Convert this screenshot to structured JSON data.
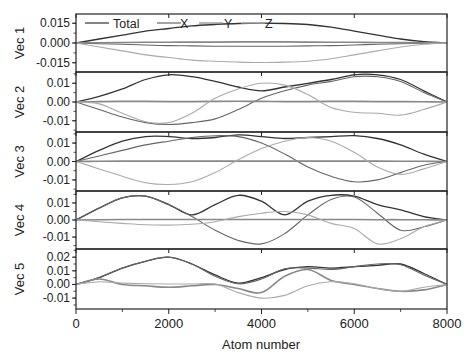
{
  "chart_data": {
    "type": "line",
    "title": "",
    "xlabel": "Atom number",
    "xlim": [
      0,
      8000
    ],
    "xticks": [
      0,
      2000,
      4000,
      6000,
      8000
    ],
    "xtick_labels": [
      "0",
      "2000",
      "4000",
      "6000",
      "8000"
    ],
    "legend": [
      "Total",
      "X",
      "Y",
      "Z"
    ],
    "legend_position": "top of first panel",
    "series_colors": {
      "Total": "#333333",
      "X": "#666666",
      "Y": "#888888",
      "Z": "#aaaaaa"
    },
    "x": [
      0,
      500,
      1000,
      1500,
      2000,
      2500,
      3000,
      3500,
      4000,
      4500,
      5000,
      5500,
      6000,
      6500,
      7000,
      7500,
      8000
    ],
    "panels": [
      {
        "ylabel": "Vec 1",
        "ylim": [
          -0.022,
          0.022
        ],
        "yticks": [
          0.015,
          0.0,
          -0.015
        ],
        "ytick_labels": [
          "0.015",
          "0.000",
          "-0.015"
        ],
        "series": [
          {
            "name": "Total",
            "values": [
              0,
              0.003,
              0.006,
              0.009,
              0.011,
              0.013,
              0.014,
              0.0148,
              0.015,
              0.0148,
              0.014,
              0.012,
              0.009,
              0.006,
              0.003,
              0.001,
              0
            ]
          },
          {
            "name": "X",
            "values": [
              0,
              -0.0005,
              -0.001,
              -0.0015,
              -0.002,
              -0.0022,
              -0.0024,
              -0.0025,
              -0.0025,
              -0.0024,
              -0.0022,
              -0.002,
              -0.0015,
              -0.001,
              -0.0006,
              -0.0002,
              0
            ]
          },
          {
            "name": "Y",
            "values": [
              0,
              0.0002,
              0.0004,
              0.0005,
              0.0006,
              0.0007,
              0.0007,
              0.0008,
              0.0008,
              0.0008,
              0.0007,
              0.0006,
              0.0005,
              0.0004,
              0.0003,
              0.0001,
              0
            ]
          },
          {
            "name": "Z",
            "values": [
              0,
              -0.003,
              -0.006,
              -0.009,
              -0.011,
              -0.013,
              -0.0138,
              -0.0145,
              -0.0148,
              -0.0145,
              -0.0138,
              -0.012,
              -0.009,
              -0.006,
              -0.003,
              -0.001,
              0
            ]
          }
        ]
      },
      {
        "ylabel": "Vec 2",
        "ylim": [
          -0.016,
          0.016
        ],
        "yticks": [
          0.01,
          0.0,
          -0.01
        ],
        "ytick_labels": [
          "0.01",
          "0.00",
          "-0.01"
        ],
        "series": [
          {
            "name": "Total",
            "values": [
              0,
              0.003,
              0.007,
              0.012,
              0.0145,
              0.0135,
              0.011,
              0.008,
              0.006,
              0.008,
              0.01,
              0.012,
              0.0145,
              0.0145,
              0.012,
              0.006,
              0
            ]
          },
          {
            "name": "X",
            "values": [
              0,
              -0.004,
              -0.008,
              -0.011,
              -0.012,
              -0.011,
              -0.009,
              -0.004,
              0.002,
              0.006,
              0.009,
              0.011,
              0.0135,
              0.0135,
              0.011,
              0.005,
              0
            ]
          },
          {
            "name": "Y",
            "values": [
              0,
              0.0002,
              0.0003,
              0.0003,
              0.0002,
              0.0002,
              0.0003,
              0.0004,
              0.0003,
              0.0002,
              0.0002,
              0.0003,
              0.0003,
              0.0002,
              0.0002,
              0.0001,
              0
            ]
          },
          {
            "name": "Z",
            "values": [
              0,
              -0.001,
              -0.006,
              -0.0105,
              -0.011,
              -0.006,
              0.002,
              0.007,
              0.01,
              0.009,
              0.004,
              -0.003,
              -0.0055,
              -0.006,
              -0.007,
              -0.004,
              0
            ]
          }
        ]
      },
      {
        "ylabel": "Vec 3",
        "ylim": [
          -0.016,
          0.016
        ],
        "yticks": [
          0.01,
          0.0,
          -0.01
        ],
        "ytick_labels": [
          "0.01",
          "0.00",
          "-0.01"
        ],
        "series": [
          {
            "name": "Total",
            "values": [
              0,
              0.006,
              0.011,
              0.0135,
              0.0135,
              0.0125,
              0.013,
              0.0145,
              0.0135,
              0.0125,
              0.013,
              0.0135,
              0.014,
              0.0125,
              0.009,
              0.004,
              0
            ]
          },
          {
            "name": "X",
            "values": [
              0,
              0.003,
              0.006,
              0.009,
              0.011,
              0.013,
              0.014,
              0.0135,
              0.01,
              0.004,
              -0.003,
              -0.008,
              -0.011,
              -0.01,
              -0.006,
              -0.002,
              0
            ]
          },
          {
            "name": "Y",
            "values": [
              0,
              0.0001,
              0.0002,
              0.0002,
              0.0002,
              0.0002,
              0.0002,
              0.0002,
              0.0002,
              0.0002,
              0.0002,
              0.0002,
              0.0002,
              0.0002,
              0.0001,
              0.0001,
              0
            ]
          },
          {
            "name": "Z",
            "values": [
              0,
              -0.004,
              -0.008,
              -0.0115,
              -0.0125,
              -0.011,
              -0.006,
              0.001,
              0.007,
              0.011,
              0.013,
              0.011,
              0.005,
              -0.003,
              -0.007,
              -0.004,
              0
            ]
          }
        ]
      },
      {
        "ylabel": "Vec 4",
        "ylim": [
          -0.017,
          0.017
        ],
        "yticks": [
          0.01,
          0.0,
          -0.01
        ],
        "ytick_labels": [
          "0.01",
          "0.00",
          "-0.01"
        ],
        "series": [
          {
            "name": "Total",
            "values": [
              0,
              0.007,
              0.013,
              0.014,
              0.009,
              0.003,
              0.009,
              0.0145,
              0.011,
              0.003,
              0.011,
              0.0145,
              0.014,
              0.009,
              0.006,
              0.002,
              0
            ]
          },
          {
            "name": "X",
            "values": [
              0,
              0.007,
              0.013,
              0.014,
              0.009,
              0.002,
              -0.006,
              -0.012,
              -0.014,
              -0.008,
              0.003,
              0.012,
              0.0135,
              0.004,
              -0.006,
              -0.004,
              0
            ]
          },
          {
            "name": "Y",
            "values": [
              0,
              0.0002,
              0.0003,
              0.0003,
              0.0003,
              0.0003,
              0.0003,
              0.0003,
              0.0003,
              0.0003,
              0.0003,
              0.0003,
              0.0003,
              0.0002,
              0.0002,
              0.0001,
              0
            ]
          },
          {
            "name": "Z",
            "values": [
              0,
              -0.001,
              -0.002,
              -0.0028,
              -0.003,
              -0.0025,
              -0.001,
              0.002,
              0.004,
              0.005,
              0.003,
              -0.002,
              -0.005,
              -0.014,
              -0.011,
              -0.004,
              0
            ]
          }
        ]
      },
      {
        "ylabel": "Vec 5",
        "ylim": [
          -0.018,
          0.026
        ],
        "yticks": [
          0.02,
          0.01,
          0.0,
          -0.01
        ],
        "ytick_labels": [
          "0.02",
          "0.01",
          "0.00",
          "-0.01"
        ],
        "series": [
          {
            "name": "Total",
            "values": [
              0,
              0.005,
              0.012,
              0.017,
              0.02,
              0.015,
              0.007,
              0.001,
              0.005,
              0.011,
              0.013,
              0.012,
              0.013,
              0.014,
              0.015,
              0.008,
              0
            ]
          },
          {
            "name": "X",
            "values": [
              0,
              0.005,
              0.012,
              0.017,
              0.02,
              0.015,
              0.006,
              0.0005,
              0.004,
              0.0115,
              0.012,
              0.011,
              0.013,
              0.015,
              0.0145,
              0.007,
              0
            ]
          },
          {
            "name": "Y",
            "values": [
              0,
              0.004,
              0.0,
              -0.001,
              -0.002,
              -0.001,
              0.0,
              -0.003,
              -0.006,
              0.006,
              0.011,
              0.003,
              0.0,
              -0.003,
              -0.005,
              -0.004,
              0
            ]
          },
          {
            "name": "Z",
            "values": [
              0,
              0.002,
              0.001,
              0.0005,
              0.0003,
              0.0003,
              0.0003,
              -0.006,
              -0.01,
              -0.008,
              -0.001,
              0.002,
              0.0005,
              -0.003,
              -0.005,
              -0.002,
              0
            ]
          }
        ]
      }
    ]
  }
}
